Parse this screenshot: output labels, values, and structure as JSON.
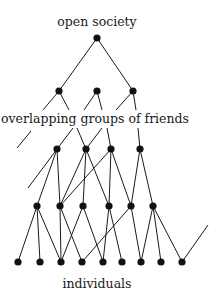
{
  "labels": {
    "top": "open society",
    "middle": "overlapping groups of friends",
    "bottom": "individuals"
  },
  "colors": {
    "line": "#1a1a1a",
    "node": "#111111",
    "background": "#ffffff"
  },
  "nodes": {
    "root": [
      {
        "x": 97,
        "y": 38
      }
    ],
    "groups_upper": [
      {
        "x": 59,
        "y": 91
      },
      {
        "x": 97,
        "y": 91
      },
      {
        "x": 133,
        "y": 91
      }
    ],
    "groups_lower": [
      {
        "x": 57,
        "y": 149
      },
      {
        "x": 86,
        "y": 149
      },
      {
        "x": 111,
        "y": 149
      },
      {
        "x": 140,
        "y": 149
      }
    ],
    "friends": [
      {
        "x": 37,
        "y": 206
      },
      {
        "x": 60,
        "y": 206
      },
      {
        "x": 83,
        "y": 206
      },
      {
        "x": 109,
        "y": 206
      },
      {
        "x": 131,
        "y": 206
      },
      {
        "x": 153,
        "y": 206
      }
    ],
    "individuals": [
      {
        "x": 18,
        "y": 262
      },
      {
        "x": 40,
        "y": 262
      },
      {
        "x": 61,
        "y": 262
      },
      {
        "x": 82,
        "y": 262
      },
      {
        "x": 103,
        "y": 262
      },
      {
        "x": 122,
        "y": 262
      },
      {
        "x": 141,
        "y": 262
      },
      {
        "x": 161,
        "y": 262
      },
      {
        "x": 182,
        "y": 262
      }
    ]
  },
  "edges": [
    [
      97,
      38,
      59,
      91
    ],
    [
      97,
      38,
      133,
      91
    ],
    [
      59,
      91,
      43,
      110
    ],
    [
      59,
      91,
      69,
      110
    ],
    [
      97,
      91,
      84,
      110
    ],
    [
      97,
      91,
      102,
      110
    ],
    [
      133,
      91,
      116,
      110
    ],
    [
      133,
      91,
      136,
      110
    ],
    [
      31,
      131,
      17,
      148
    ],
    [
      73,
      128,
      57,
      149
    ],
    [
      77,
      128,
      86,
      149
    ],
    [
      102,
      128,
      86,
      149
    ],
    [
      107,
      128,
      111,
      149
    ],
    [
      138,
      128,
      140,
      149
    ],
    [
      57,
      149,
      28,
      188
    ],
    [
      57,
      149,
      37,
      206
    ],
    [
      57,
      149,
      60,
      206
    ],
    [
      86,
      149,
      60,
      206
    ],
    [
      86,
      149,
      83,
      206
    ],
    [
      86,
      149,
      109,
      206
    ],
    [
      111,
      149,
      60,
      206
    ],
    [
      111,
      149,
      109,
      206
    ],
    [
      111,
      149,
      131,
      206
    ],
    [
      140,
      149,
      131,
      206
    ],
    [
      140,
      149,
      153,
      206
    ],
    [
      37,
      206,
      18,
      262
    ],
    [
      37,
      206,
      40,
      262
    ],
    [
      37,
      206,
      61,
      262
    ],
    [
      60,
      206,
      61,
      262
    ],
    [
      60,
      206,
      82,
      262
    ],
    [
      83,
      206,
      61,
      262
    ],
    [
      83,
      206,
      103,
      262
    ],
    [
      109,
      206,
      103,
      262
    ],
    [
      109,
      206,
      122,
      262
    ],
    [
      131,
      206,
      82,
      262
    ],
    [
      131,
      206,
      141,
      262
    ],
    [
      153,
      206,
      141,
      262
    ],
    [
      153,
      206,
      161,
      262
    ],
    [
      153,
      206,
      182,
      262
    ],
    [
      182,
      262,
      208,
      225
    ]
  ]
}
